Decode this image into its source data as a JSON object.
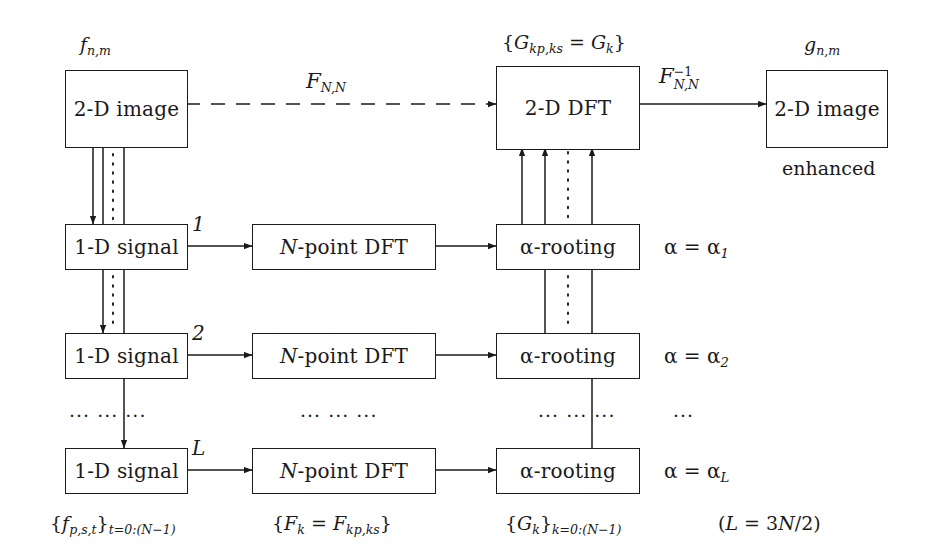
{
  "diagram": {
    "stroke_color": "#1a1a1a",
    "background": "#ffffff"
  },
  "boxes": {
    "input_image": "2-D image",
    "output_image": "2-D image",
    "dft2d": "2-D DFT",
    "signal_row1": "1-D signal",
    "signal_row2": "1-D signal",
    "signal_row3": "1-D signal",
    "npoint_row1": "N-point DFT",
    "npoint_row2": "N-point DFT",
    "npoint_row3": "N-point DFT",
    "rooting_row1": "α-rooting",
    "rooting_row2": "α-rooting",
    "rooting_row3": "α-rooting"
  },
  "labels": {
    "input_symbol": "f_{n,m}",
    "output_symbol": "g_{n,m}",
    "dft2d_symbol": "{G_{kp,ks} = G_k}",
    "forward_transform": "F_{N,N}",
    "inverse_transform": "F^{-1}_{N,N}",
    "enhanced": "enhanced",
    "row_index_1": "1",
    "row_index_2": "2",
    "row_index_3": "L",
    "alpha_row1": "α = α_1",
    "alpha_row2": "α = α_2",
    "alpha_row3": "α = α_L",
    "alpha_ellipsis": "···"
  },
  "captions": {
    "signals": "{f_{p,s,t}}_{t=0:(N-1)}",
    "coefficients": "{F_k = F_{kp,ks}}",
    "rooted": "{G_k}_{k=0:(N-1)}",
    "count": "(L = 3N/2)"
  },
  "ellipses": {
    "col1": "···  ···  ···",
    "col2": "···  ···  ···",
    "col3": "···  ···  ···",
    "col4": "···"
  }
}
